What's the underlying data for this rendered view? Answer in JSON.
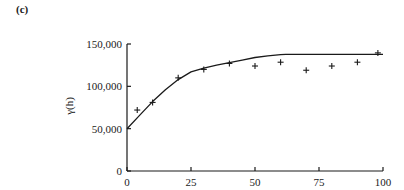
{
  "panel_label": "(c)",
  "chart_data": {
    "type": "scatter",
    "title": "",
    "xlabel": "",
    "ylabel": "γ(h)",
    "xlim": [
      0,
      100
    ],
    "ylim": [
      0,
      150000
    ],
    "grid": false,
    "legend": null,
    "x_ticks": [
      0,
      25,
      50,
      75,
      100
    ],
    "x_tick_labels": [
      "0",
      "25",
      "50",
      "75",
      "100"
    ],
    "y_ticks": [
      0,
      50000,
      100000,
      150000
    ],
    "y_tick_labels": [
      "0",
      "50,000",
      "100,000",
      "150,000"
    ],
    "series": [
      {
        "name": "empirical semivariogram",
        "type": "scatter",
        "marker": "+",
        "x": [
          4,
          10,
          20,
          30,
          40,
          50,
          60,
          70,
          80,
          90,
          98
        ],
        "y": [
          72000,
          81000,
          110000,
          120000,
          127000,
          124000,
          128500,
          119000,
          124000,
          128500,
          139500
        ]
      },
      {
        "name": "fitted model",
        "type": "line",
        "x": [
          0,
          5,
          10,
          15,
          20,
          25,
          30,
          35,
          40,
          45,
          50,
          55,
          60,
          62,
          70,
          80,
          90,
          100
        ],
        "y": [
          50000,
          66000,
          82000,
          96000,
          108000,
          117000,
          121500,
          125000,
          128000,
          131000,
          134000,
          136000,
          137500,
          137800,
          137800,
          137800,
          137800,
          137800
        ]
      }
    ]
  },
  "colors": {
    "ink": "#1a1a1a",
    "background": "#ffffff"
  }
}
